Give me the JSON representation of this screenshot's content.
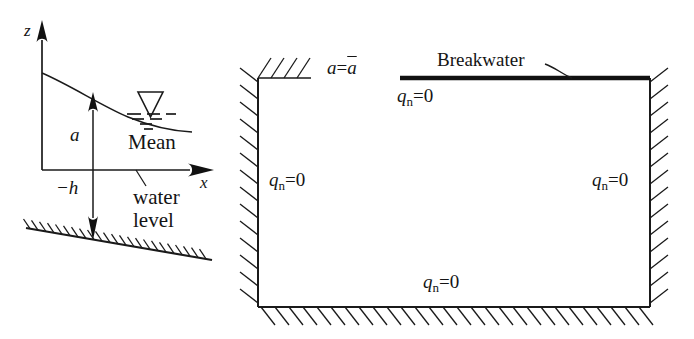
{
  "figure": {
    "title_present": false,
    "background_color": "#ffffff",
    "line_color": "#1a1a1a",
    "panels": [
      "definition-sketch",
      "boundary-value-domain"
    ]
  },
  "left_panel": {
    "name": "definition-sketch",
    "axes": {
      "vertical_label": "z",
      "horizontal_label": "x",
      "origin_label": ""
    },
    "annotations": {
      "amplitude_label": "a",
      "depth_label": "−h",
      "mean_level_line1": "Mean",
      "mean_level_line2": "water",
      "mean_level_line3": "level",
      "water_surface_symbol": "inverted-triangle-water-level-symbol",
      "seabed": "hatched-sloping-bed"
    }
  },
  "right_panel": {
    "name": "boundary-value-domain",
    "labels": {
      "top_boundary_condition": "a=ā",
      "top_boundary_condition_plain": "a",
      "top_boundary_condition_eq": "=",
      "top_boundary_condition_bar": "a",
      "breakwater": "Breakwater",
      "flux_symbol": "q",
      "flux_subscript": "n",
      "flux_equals_zero": "=0"
    },
    "boundary_conditions": [
      {
        "position": "breakwater-underside",
        "text": "q_n=0"
      },
      {
        "position": "left-wall",
        "text": "q_n=0"
      },
      {
        "position": "right-wall",
        "text": "q_n=0"
      },
      {
        "position": "bottom-wall",
        "text": "q_n=0"
      }
    ],
    "features": {
      "breakwater_line": "thick-horizontal-segment",
      "leader_line": "breakwater-pointer-curve",
      "hatching": "outward-hatched-rigid-boundaries"
    }
  }
}
